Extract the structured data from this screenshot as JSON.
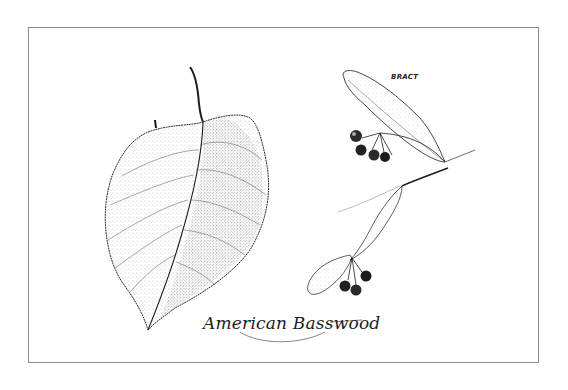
{
  "illustration": {
    "subject": "American Basswood leaf and fruiting branch with bracts",
    "style": "pen-and-ink stipple drawing",
    "labels": {
      "bract": "BRACT"
    },
    "caption": "American Basswood",
    "colors": {
      "ink": "#1c1c1c",
      "paper": "#ffffff",
      "frame": "#8a8a8a"
    }
  }
}
